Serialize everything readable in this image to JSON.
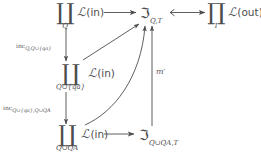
{
  "diagram": {
    "type": "commutative-diagram",
    "background_color": "#ffffff",
    "ink_color": "#4d4d4d",
    "nodes": {
      "top_left": {
        "operator": "∐",
        "operator_name": "coproduct",
        "limit": "Q",
        "functor": "ℒ(in)",
        "functor_script": "ℒ",
        "functor_arg": "in"
      },
      "top_mid": {
        "symbol": "ℑ",
        "subscript": "Q,T"
      },
      "top_right": {
        "operator": "∏",
        "operator_name": "product",
        "limit": "T",
        "functor": "ℒ(out)",
        "functor_script": "ℒ",
        "functor_arg": "out"
      },
      "mid_left": {
        "operator": "∐",
        "operator_name": "coproduct",
        "limit": "Q∪{qa}",
        "functor": "ℒ(in)",
        "functor_script": "ℒ",
        "functor_arg": "in"
      },
      "bottom_left": {
        "operator": "∐",
        "operator_name": "coproduct",
        "limit": "Q∪QA",
        "functor": "ℒ(in)",
        "functor_script": "ℒ",
        "functor_arg": "in"
      },
      "bottom_mid": {
        "symbol": "ℑ",
        "subscript": "Q∪QA,T"
      }
    },
    "edge_labels": {
      "inc_upper": {
        "name": "inc",
        "subscript": "Q,Q∪{qa}"
      },
      "inc_lower": {
        "name": "inc",
        "subscript": "Q∪{qa},Q∪QA"
      },
      "m_prime": "m′"
    }
  }
}
